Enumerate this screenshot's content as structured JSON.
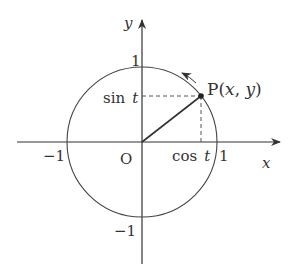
{
  "diagram": {
    "colors": {
      "stroke": "#333333",
      "background": "#ffffff"
    },
    "axes": {
      "x_label": "x",
      "y_label": "y",
      "origin_label": "O"
    },
    "ticks": {
      "x_pos": "1",
      "x_neg": "−1",
      "y_pos": "1",
      "y_neg": "−1"
    },
    "point": {
      "name": "P",
      "label_prefix": "P(",
      "label_x": "x",
      "label_sep": ", ",
      "label_y": "y",
      "label_suffix": ")"
    },
    "projections": {
      "sin_fn": "sin",
      "cos_fn": "cos",
      "var": "t"
    }
  }
}
